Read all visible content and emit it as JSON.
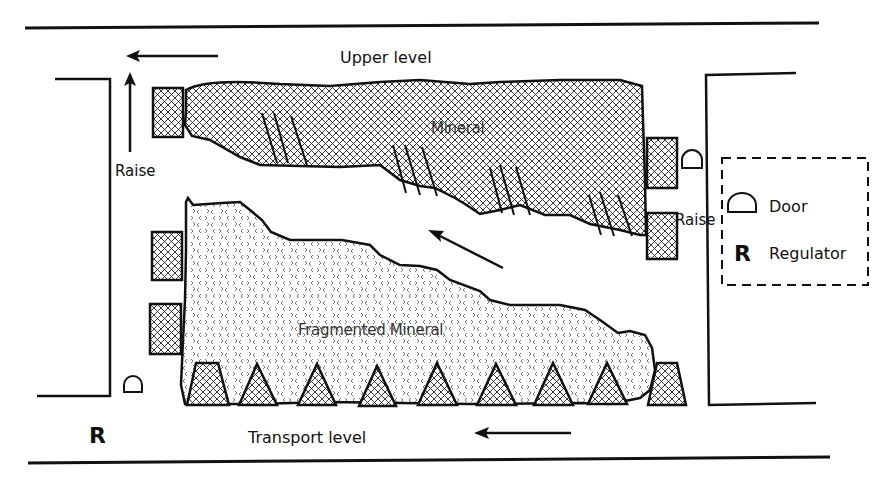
{
  "diagram": {
    "labels": {
      "upper_level": "Upper level",
      "transport_level": "Transport level",
      "raise_left": "Raise",
      "raise_right": "Raise",
      "mineral": "Mineral",
      "fragmented_mineral": "Fragmented Mineral",
      "regulator_symbol_left": "R"
    },
    "legend": {
      "items": [
        {
          "symbol": "door-icon",
          "label": "Door"
        },
        {
          "symbol": "R",
          "label": "Regulator"
        }
      ]
    },
    "flow_arrows": [
      {
        "name": "upper-level-flow",
        "direction": "left"
      },
      {
        "name": "raise-flow",
        "direction": "up"
      },
      {
        "name": "stope-flow",
        "direction": "up-left"
      },
      {
        "name": "transport-level-flow",
        "direction": "left"
      }
    ],
    "colors": {
      "line": "#111111",
      "background": "#ffffff",
      "hatch": "#222222"
    },
    "counts": {
      "draw_points": 8,
      "pillar_blocks_left": 3,
      "pillar_blocks_right": 2
    }
  }
}
